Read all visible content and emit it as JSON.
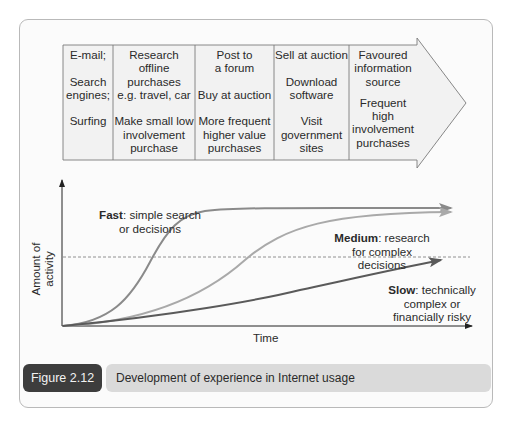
{
  "stages": {
    "columns": [
      {
        "lines": [
          "E-mail;",
          "Search engines;",
          "Surfing"
        ]
      },
      {
        "lines": [
          "Research offline purchases e.g. travel, car",
          "Make small low involvement purchase"
        ]
      },
      {
        "lines": [
          "Post to a forum",
          "Buy at auction",
          "More frequent higher value purchases"
        ]
      },
      {
        "lines": [
          "Sell at auction",
          "Download software",
          "Visit government sites"
        ]
      },
      {
        "lines": [
          "Favoured information source",
          "Frequent high involvement purchases"
        ]
      }
    ],
    "col0": {
      "l1": "E-mail;",
      "l2a": "Search",
      "l2b": "engines;",
      "l3": "Surfing"
    },
    "col1": {
      "l1a": "Research",
      "l1b": "offline",
      "l1c": "purchases",
      "l1d": "e.g. travel, car",
      "l2a": "Make small low",
      "l2b": "involvement",
      "l2c": "purchase"
    },
    "col2": {
      "l1a": "Post to",
      "l1b": "a forum",
      "l2": "Buy at auction",
      "l3a": "More frequent",
      "l3b": "higher value",
      "l3c": "purchases"
    },
    "col3": {
      "l1": "Sell at auction",
      "l2a": "Download",
      "l2b": "software",
      "l3a": "Visit",
      "l3b": "government",
      "l3c": "sites"
    },
    "col4": {
      "l1a": "Favoured",
      "l1b": "information",
      "l1c": "source",
      "l2a": "Frequent",
      "l2b": "high",
      "l2c": "involvement",
      "l2d": "purchases"
    }
  },
  "graph": {
    "x_axis_label": "Time",
    "y_axis_label": "Amount of activity",
    "curves": {
      "fast": {
        "name": "Fast",
        "desc_a": ": simple search",
        "desc_b": "or decisions"
      },
      "medium": {
        "name": "Medium",
        "desc_a": ": research",
        "desc_b": "for complex",
        "desc_c": "decisions"
      },
      "slow": {
        "name": "Slow",
        "desc_a": ": technically",
        "desc_b": "complex or",
        "desc_c": "financially risky"
      }
    }
  },
  "caption": {
    "figure_number": "Figure 2.12",
    "title": "Development of experience in Internet usage"
  },
  "colors": {
    "frame_border": "#b9b9b9",
    "arrow_fill": "#f1f1f1",
    "fast_curve": "#8a8a8a",
    "medium_curve": "#a9a9a9",
    "slow_curve": "#5a5a5a",
    "caption_dark": "#3d3d3d",
    "caption_light": "#dadada"
  }
}
